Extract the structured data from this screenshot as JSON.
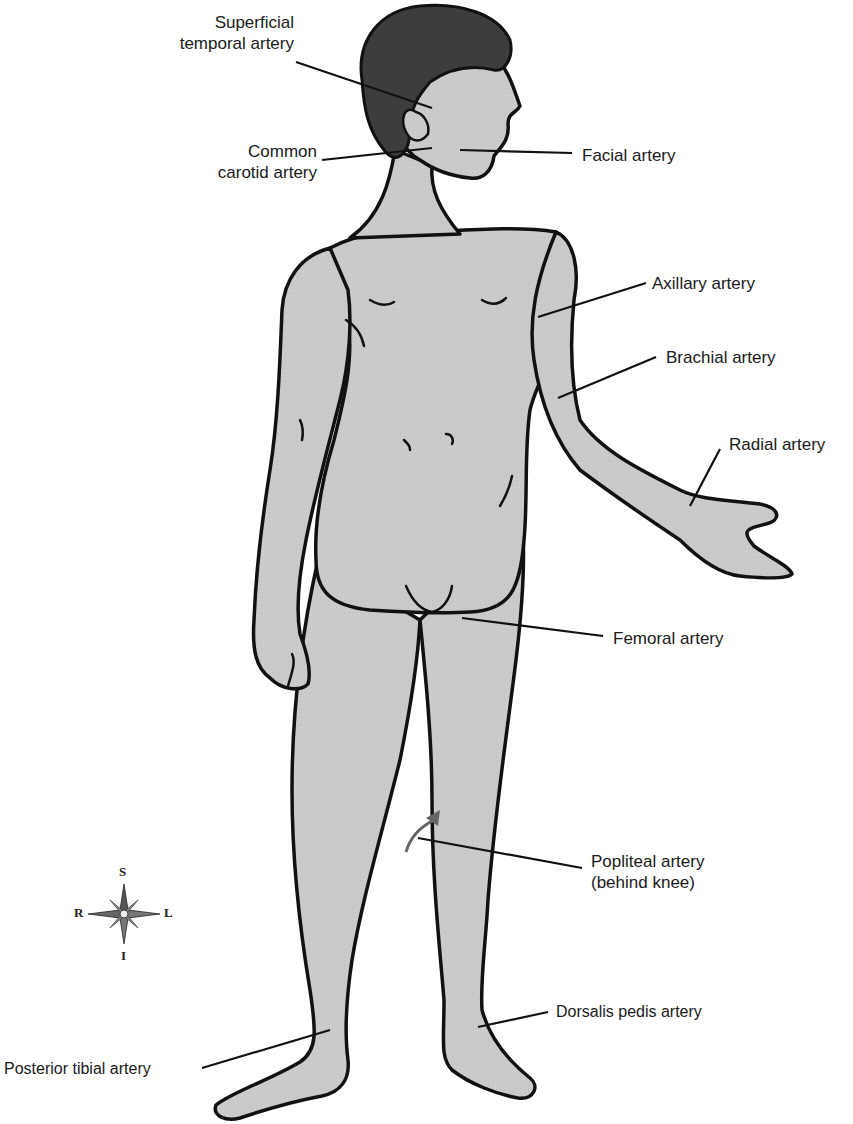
{
  "diagram": {
    "colors": {
      "skin": "#c9c9c9",
      "hair": "#3f3f3f",
      "outline": "#111111",
      "leader": "#111111",
      "arrow": "#666666"
    },
    "labels": [
      {
        "id": "superficial-temporal",
        "text_line1": "Superficial",
        "text_line2": "temporal artery"
      },
      {
        "id": "common-carotid",
        "text_line1": "Common",
        "text_line2": "carotid artery"
      },
      {
        "id": "facial",
        "text_line1": "Facial artery"
      },
      {
        "id": "axillary",
        "text_line1": "Axillary artery"
      },
      {
        "id": "brachial",
        "text_line1": "Brachial artery"
      },
      {
        "id": "radial",
        "text_line1": "Radial artery"
      },
      {
        "id": "femoral",
        "text_line1": "Femoral artery"
      },
      {
        "id": "popliteal",
        "text_line1": "Popliteal artery",
        "text_line2": "(behind knee)"
      },
      {
        "id": "dorsalis-pedis",
        "text_line1": "Dorsalis pedis artery"
      },
      {
        "id": "posterior-tibial",
        "text_line1": "Posterior tibial artery"
      }
    ],
    "compass": {
      "superior": "S",
      "inferior": "I",
      "right": "R",
      "left": "L"
    }
  }
}
